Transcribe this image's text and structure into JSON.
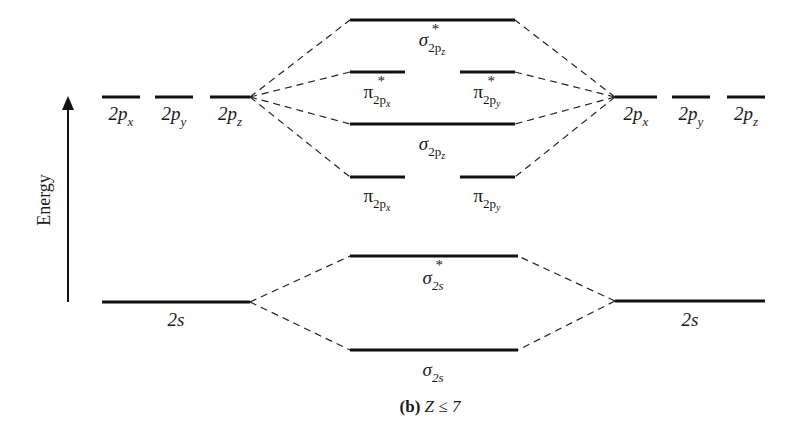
{
  "axis": {
    "label": "Energy"
  },
  "atomic_left": {
    "p": [
      "2p",
      "2p",
      "2p"
    ],
    "p_subs": [
      "x",
      "y",
      "z"
    ],
    "s": "2s"
  },
  "atomic_right": {
    "p": [
      "2p",
      "2p",
      "2p"
    ],
    "p_subs": [
      "x",
      "y",
      "z"
    ],
    "s": "2s"
  },
  "molecular": {
    "sigma_star_2pz": {
      "symbol": "σ",
      "sub": "2p",
      "subsub": "z",
      "star": "*"
    },
    "pi_star_2px": {
      "symbol": "π",
      "sub": "2p",
      "subsub": "x",
      "star": "*"
    },
    "pi_star_2py": {
      "symbol": "π",
      "sub": "2p",
      "subsub": "y",
      "star": "*"
    },
    "sigma_2pz": {
      "symbol": "σ",
      "sub": "2p",
      "subsub": "z"
    },
    "pi_2px": {
      "symbol": "π",
      "sub": "2p",
      "subsub": "x"
    },
    "pi_2py": {
      "symbol": "π",
      "sub": "2p",
      "subsub": "y"
    },
    "sigma_star_2s": {
      "symbol": "σ",
      "sub": "2s",
      "star": "*"
    },
    "sigma_2s": {
      "symbol": "σ",
      "sub": "2s"
    }
  },
  "caption": {
    "bold": "(b)",
    "text": " Z ≤ 7"
  }
}
